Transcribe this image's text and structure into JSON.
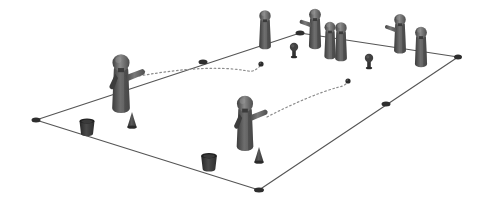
{
  "scene": {
    "title": "Training Field Drill Diagram",
    "background_color": "#ffffff",
    "width": 486,
    "height": 209,
    "projection": "isometric-3d",
    "style": "grayscale shaded 3d render"
  },
  "field": {
    "name": "pitch-outline",
    "shape": "quadrilateral",
    "stroke_color": "#555555",
    "stroke_width": 1.1,
    "fill": "none",
    "corners": [
      {
        "name": "corner-left",
        "x": 36,
        "y": 120
      },
      {
        "name": "corner-top",
        "x": 300,
        "y": 33
      },
      {
        "name": "corner-right",
        "x": 458,
        "y": 57
      },
      {
        "name": "corner-bottom",
        "x": 259,
        "y": 190
      }
    ],
    "edge_markers": [
      {
        "name": "edge-marker-top-left",
        "x": 203,
        "y": 62,
        "w": 9,
        "h": 5
      },
      {
        "name": "edge-marker-top-right",
        "x": 300,
        "y": 33,
        "w": 9,
        "h": 5
      },
      {
        "name": "edge-marker-right-edge",
        "x": 386,
        "y": 104,
        "w": 9,
        "h": 5
      },
      {
        "name": "edge-marker-far-right",
        "x": 458,
        "y": 57,
        "w": 8,
        "h": 5
      },
      {
        "name": "edge-marker-left",
        "x": 36,
        "y": 120,
        "w": 9,
        "h": 5
      },
      {
        "name": "edge-marker-bottom",
        "x": 259,
        "y": 190,
        "w": 10,
        "h": 5
      }
    ]
  },
  "colors": {
    "figure_dark": "#3c3c3c",
    "figure_mid": "#555555",
    "figure_light": "#6e6e6e",
    "figure_highlight": "#8a8a8a",
    "head": "#4a4a4a",
    "bucket": "#333333",
    "cone": "#3a3a3a",
    "ball": "#2b2b2b",
    "line": "#555555",
    "trajectory": "#8c8c8c"
  },
  "figures": [
    {
      "name": "figure-thrower-left",
      "role": "thrower",
      "x": 121,
      "y": 78,
      "scale": 1.38,
      "arm": "right",
      "arm_dir": "right-up",
      "label": "Pointing / throwing player, left side"
    },
    {
      "name": "figure-thrower-center",
      "role": "thrower",
      "x": 245,
      "y": 118,
      "scale": 1.3,
      "arm": "right",
      "arm_dir": "right-up",
      "label": "Pointing / throwing player, center"
    },
    {
      "name": "figure-queue-1",
      "role": "waiting",
      "x": 265,
      "y": 26,
      "scale": 0.92,
      "arm": "none",
      "label": "Waiting player 1"
    },
    {
      "name": "figure-queue-2",
      "role": "waiting",
      "x": 315,
      "y": 25,
      "scale": 0.95,
      "arm": "left",
      "arm_dir": "left-flat",
      "label": "Waiting player 2"
    },
    {
      "name": "figure-queue-3",
      "role": "waiting",
      "x": 330,
      "y": 37,
      "scale": 0.88,
      "arm": "none",
      "label": "Waiting player 3"
    },
    {
      "name": "figure-queue-4",
      "role": "waiting",
      "x": 341,
      "y": 38,
      "scale": 0.92,
      "arm": "none",
      "label": "Waiting player 4"
    },
    {
      "name": "figure-queue-5",
      "role": "waiting",
      "x": 400,
      "y": 30,
      "scale": 0.93,
      "arm": "left",
      "arm_dir": "left-flat",
      "label": "Waiting player 5"
    },
    {
      "name": "figure-queue-6",
      "role": "waiting",
      "x": 421,
      "y": 43,
      "scale": 0.95,
      "arm": "none",
      "label": "Waiting player 6"
    }
  ],
  "buckets": [
    {
      "name": "bucket-left",
      "x": 87,
      "y": 128,
      "scale": 1.0
    },
    {
      "name": "bucket-bottom",
      "x": 209,
      "y": 163,
      "scale": 1.05
    }
  ],
  "cones": [
    {
      "name": "cone-left-field",
      "x": 132,
      "y": 122,
      "scale": 1.0
    },
    {
      "name": "cone-center-field",
      "x": 259,
      "y": 157,
      "scale": 1.0
    }
  ],
  "posts": [
    {
      "name": "post-top-center",
      "x": 294,
      "y": 51,
      "scale": 1.0
    },
    {
      "name": "post-mid-right",
      "x": 369,
      "y": 62,
      "scale": 1.0
    }
  ],
  "balls": [
    {
      "name": "ball-target-upper",
      "x": 261,
      "y": 64
    },
    {
      "name": "ball-target-lower",
      "x": 348,
      "y": 81
    }
  ],
  "trajectories": [
    {
      "name": "trajectory-upper-arc",
      "from": "figure-thrower-left",
      "to": "ball-target-upper",
      "style": "dotted",
      "path": "M 139 76 C 185 68 220 66 248 71 C 254 72 257 69 261 65",
      "stroke": "#8c8c8c",
      "dash": "1.6 2.6"
    },
    {
      "name": "trajectory-lower-arc",
      "from": "figure-thrower-center",
      "to": "ball-target-lower",
      "style": "dotted",
      "path": "M 267 117 C 292 104 320 92 339 87 C 344 86 346 84 348 82",
      "stroke": "#8c8c8c",
      "dash": "1.6 2.6"
    }
  ]
}
